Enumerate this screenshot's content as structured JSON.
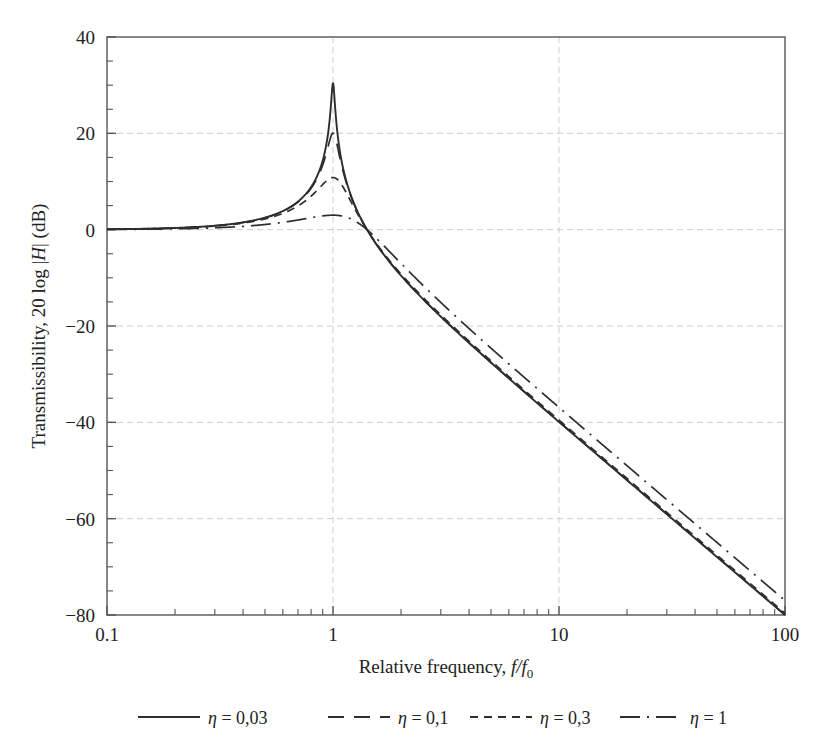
{
  "chart_data": {
    "type": "line",
    "title": "",
    "xlabel": "Relative frequency, f/f0",
    "ylabel": "Transmissibility, 20 log |H| (dB)",
    "xscale": "log",
    "xlim": [
      0.1,
      100
    ],
    "ylim": [
      -80,
      40
    ],
    "xticks": [
      0.1,
      1,
      10,
      100
    ],
    "xticklabels": [
      "0.1",
      "1",
      "10",
      "100"
    ],
    "yticks": [
      -80,
      -60,
      -40,
      -20,
      0,
      20,
      40
    ],
    "yticklabels": [
      "-80",
      "-60",
      "-40",
      "-20",
      "0",
      "20",
      "40"
    ],
    "grid": true,
    "legend_position": "bottom",
    "series": [
      {
        "name": "eta = 0,03",
        "label": "η = 0,03",
        "eta": 0.03,
        "linestyle": "solid",
        "dasharray": "none",
        "color": "#2e2e2e",
        "peak_db": 30.5,
        "peak_x": 1.0,
        "x": [
          0.1,
          0.15,
          0.2,
          0.3,
          0.4,
          0.5,
          0.6,
          0.7,
          0.8,
          0.9,
          0.95,
          0.98,
          1.0,
          1.02,
          1.05,
          1.1,
          1.2,
          1.4,
          1.6,
          2,
          3,
          5,
          10,
          20,
          50,
          100
        ],
        "y": [
          0.09,
          0.2,
          0.35,
          0.83,
          1.6,
          2.5,
          3.9,
          5.9,
          8.9,
          14.4,
          19.5,
          24.0,
          30.5,
          24.0,
          19.6,
          14.0,
          8.3,
          2.9,
          0.5,
          -4.4,
          -18.0,
          -27.6,
          -40.0,
          -52.0,
          -67.9,
          -79.9
        ]
      },
      {
        "name": "eta = 0,1",
        "label": "η = 0,1",
        "eta": 0.1,
        "linestyle": "dashed",
        "dasharray": "16,10",
        "color": "#2e2e2e",
        "peak_db": 20.0,
        "peak_x": 1.0,
        "x": [
          0.1,
          0.15,
          0.2,
          0.3,
          0.4,
          0.5,
          0.6,
          0.7,
          0.8,
          0.9,
          0.95,
          0.98,
          1.0,
          1.02,
          1.05,
          1.1,
          1.2,
          1.4,
          1.6,
          2,
          3,
          5,
          10,
          20,
          50,
          100
        ],
        "y": [
          0.09,
          0.2,
          0.35,
          0.83,
          1.6,
          2.5,
          3.9,
          5.8,
          8.6,
          13.0,
          16.2,
          18.5,
          20.0,
          18.5,
          16.3,
          13.0,
          8.1,
          2.9,
          0.5,
          -4.4,
          -18.0,
          -27.6,
          -40.0,
          -52.0,
          -67.9,
          -79.9
        ]
      },
      {
        "name": "eta = 0,3",
        "label": "η = 0,3",
        "eta": 0.3,
        "linestyle": "dashed-short",
        "dasharray": "8,6",
        "color": "#2e2e2e",
        "peak_db": 10.5,
        "peak_x": 1.0,
        "x": [
          0.1,
          0.15,
          0.2,
          0.3,
          0.4,
          0.5,
          0.6,
          0.7,
          0.8,
          0.9,
          0.95,
          0.98,
          1.0,
          1.02,
          1.05,
          1.1,
          1.2,
          1.4,
          1.6,
          2,
          3,
          5,
          10,
          20,
          50,
          100
        ],
        "y": [
          0.09,
          0.2,
          0.35,
          0.82,
          1.55,
          2.4,
          3.6,
          5.2,
          7.2,
          9.4,
          10.2,
          10.4,
          10.5,
          10.4,
          10.1,
          9.2,
          7.0,
          2.8,
          0.5,
          -4.2,
          -17.8,
          -27.5,
          -40.0,
          -52.0,
          -67.9,
          -79.9
        ]
      },
      {
        "name": "eta = 1",
        "label": "η = 1",
        "eta": 1.0,
        "linestyle": "dashdot",
        "dasharray": "20,7,2,7",
        "color": "#2e2e2e",
        "peak_db": 3.5,
        "peak_x": 1.0,
        "x": [
          0.1,
          0.15,
          0.2,
          0.3,
          0.4,
          0.5,
          0.6,
          0.7,
          0.8,
          0.9,
          0.95,
          1.0,
          1.05,
          1.1,
          1.2,
          1.4,
          1.6,
          2,
          3,
          5,
          10,
          20,
          50,
          100
        ],
        "y": [
          0.09,
          0.2,
          0.34,
          0.78,
          1.4,
          2.1,
          2.8,
          3.2,
          3.4,
          3.5,
          3.5,
          3.5,
          3.4,
          3.3,
          2.9,
          1.6,
          0.1,
          -3.2,
          -15.2,
          -25.6,
          -38.5,
          -50.9,
          -67.1,
          -79.2
        ]
      }
    ]
  },
  "axes": {
    "x_title_prefix": "Relative frequency, ",
    "x_title_var_f": "f",
    "x_title_slash": "/",
    "x_title_var_f0": "f",
    "x_title_sub0": "0",
    "y_title_prefix": "Transmissibility, 20 log |",
    "y_title_var_H": "H",
    "y_title_suffix": "| (dB)"
  },
  "legend": {
    "entries": [
      {
        "label_eta": "η",
        "label_eq": " = 0,03",
        "style": "solid"
      },
      {
        "label_eta": "η",
        "label_eq": " = 0,1",
        "style": "dashed"
      },
      {
        "label_eta": "η",
        "label_eq": " = 0,3",
        "style": "dashed-short"
      },
      {
        "label_eta": "η",
        "label_eq": " = 1",
        "style": "dashdot"
      }
    ]
  },
  "style": {
    "axis_color": "#555555",
    "grid_color": "#c8c8c8",
    "curve_color": "#2e2e2e",
    "background": "#ffffff"
  }
}
